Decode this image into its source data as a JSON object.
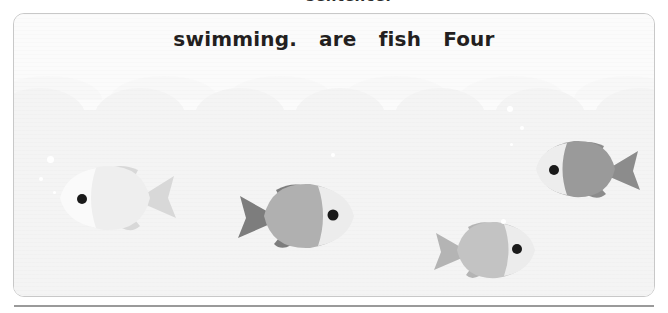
{
  "page": {
    "top_fragment_text": "sentence.",
    "background_color": "#ffffff"
  },
  "exercise_card": {
    "border_color": "#c8c8c8",
    "background_color": "#fdfdfd"
  },
  "scrambled_sentence": {
    "words": [
      {
        "text": "swimming."
      },
      {
        "text": "are"
      },
      {
        "text": "fish"
      },
      {
        "text": "Four"
      }
    ],
    "text_color": "#231f20"
  },
  "scene": {
    "name": "underwater-scene",
    "water_color": "#f4f4f4",
    "surface_color": "#fbfbfb",
    "fish": [
      {
        "name": "fish-1",
        "facing": "left",
        "body_color": "#eeeeee",
        "fin_color": "#d8d8d8",
        "head_color": "#fafafa",
        "eye_color": "#1a1a1a",
        "left": 42,
        "top": 142,
        "width": 122,
        "height": 84
      },
      {
        "name": "fish-2",
        "facing": "right",
        "body_color": "#b0b0b0",
        "fin_color": "#7d7d7d",
        "head_color": "#ececec",
        "eye_color": "#1a1a1a",
        "left": 222,
        "top": 160,
        "width": 126,
        "height": 82
      },
      {
        "name": "fish-3",
        "facing": "right",
        "body_color": "#c3c3c3",
        "fin_color": "#b4b4b4",
        "head_color": "#ececec",
        "eye_color": "#1a1a1a",
        "left": 418,
        "top": 199,
        "width": 110,
        "height": 72
      },
      {
        "name": "fish-4",
        "facing": "left",
        "body_color": "#9a9a9a",
        "fin_color": "#8c8c8c",
        "head_color": "#ededed",
        "eye_color": "#1a1a1a",
        "left": 516,
        "top": 119,
        "width": 112,
        "height": 72
      }
    ],
    "bubbles": [
      {
        "name": "bubble-1",
        "left": 46,
        "top": 155,
        "size": 7
      },
      {
        "name": "bubble-2",
        "left": 38,
        "top": 176,
        "size": 4
      },
      {
        "name": "bubble-3",
        "left": 52,
        "top": 190,
        "size": 3
      },
      {
        "name": "bubble-4",
        "left": 506,
        "top": 105,
        "size": 6
      },
      {
        "name": "bubble-5",
        "left": 519,
        "top": 125,
        "size": 4
      },
      {
        "name": "bubble-6",
        "left": 509,
        "top": 142,
        "size": 3
      },
      {
        "name": "bubble-7",
        "left": 500,
        "top": 218,
        "size": 5
      },
      {
        "name": "bubble-8",
        "left": 330,
        "top": 152,
        "size": 4
      }
    ]
  }
}
